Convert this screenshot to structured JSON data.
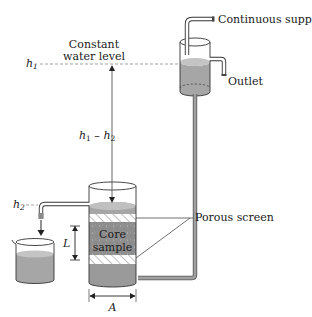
{
  "diagram": {
    "labels": {
      "continuous_supply": "Continuous supply",
      "outlet": "Outlet",
      "constant_level_line1": "Constant",
      "constant_level_line2": "water level",
      "h1": "h",
      "h1_sub": "1",
      "h2": "h",
      "h2_sub": "2",
      "head_diff_h": "h",
      "head_diff_sub1": "1",
      "head_diff_minus": " – ",
      "head_diff_h2": "h",
      "head_diff_sub2": "2",
      "porous_screen": "Porous screen",
      "core_line1": "Core",
      "core_line2": "sample",
      "length": "L",
      "area": "A"
    },
    "colors": {
      "water": "#a6a6a6",
      "water_light": "#c4c4c4",
      "core": "#8c8c8c",
      "outline": "#333333",
      "tube": "#9a9a9a",
      "dash": "#888888"
    }
  }
}
